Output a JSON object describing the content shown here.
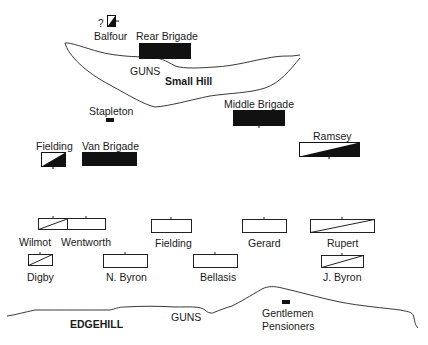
{
  "terrain": {
    "small_hill_label": "Small Hill",
    "edgehill_label": "EDGEHILL",
    "guns_top_label": "GUNS",
    "guns_bottom_label": "GUNS",
    "gentlemen_pensioners_line1": "Gentlemen",
    "gentlemen_pensioners_line2": "Pensioners"
  },
  "units": {
    "balfour": {
      "label": "Balfour",
      "prefix": "?",
      "symbol": "half-filled-diagonal"
    },
    "rear_brigade": {
      "label": "Rear Brigade",
      "symbol": "filled"
    },
    "stapleton": {
      "label": "Stapleton",
      "symbol": "small-filled"
    },
    "middle_brigade": {
      "label": "Middle Brigade",
      "symbol": "filled"
    },
    "ramsey": {
      "label": "Ramsey",
      "symbol": "half-filled-diagonal"
    },
    "fielding_cav": {
      "label": "Fielding",
      "symbol": "half-filled-diagonal"
    },
    "van_brigade": {
      "label": "Van Brigade",
      "symbol": "filled"
    },
    "wilmot": {
      "label": "Wilmot",
      "symbol": "diagonal-line"
    },
    "wentworth": {
      "label": "Wentworth",
      "symbol": "empty"
    },
    "fielding_inf": {
      "label": "Fielding",
      "symbol": "empty"
    },
    "gerard": {
      "label": "Gerard",
      "symbol": "empty"
    },
    "rupert": {
      "label": "Rupert",
      "symbol": "diagonal-line"
    },
    "digby": {
      "label": "Digby",
      "symbol": "diagonal-line"
    },
    "n_byron": {
      "label": "N. Byron",
      "symbol": "empty"
    },
    "bellasis": {
      "label": "Bellasis",
      "symbol": "empty"
    },
    "j_byron": {
      "label": "J. Byron",
      "symbol": "diagonal-line"
    },
    "gentlemen_pensioners": {
      "symbol": "small-filled"
    }
  },
  "colors": {
    "ink": "#111111",
    "background": "#ffffff"
  }
}
